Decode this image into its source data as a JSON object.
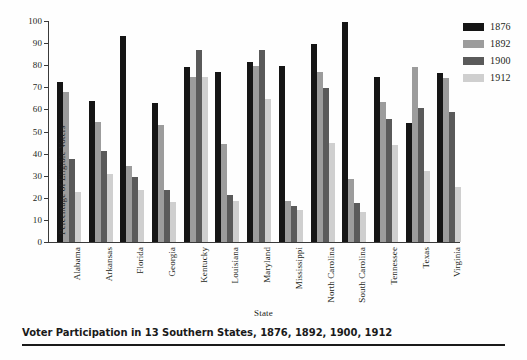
{
  "caption": {
    "text": "Voter Participation in 13 Southern States, 1876, 1892, 1900, 1912"
  },
  "legend": {
    "position": "top-right",
    "entries": [
      {
        "label": "1876",
        "color": "#151515"
      },
      {
        "label": "1892",
        "color": "#9c9c9c"
      },
      {
        "label": "1900",
        "color": "#5a5a5a"
      },
      {
        "label": "1912",
        "color": "#cfcfcf"
      }
    ]
  },
  "axes": {
    "y_title": "Percentage of Eligible Voters",
    "x_title": "State",
    "y_ticks": [
      "0",
      "10",
      "20",
      "30",
      "40",
      "50",
      "60",
      "70",
      "80",
      "90",
      "100"
    ]
  },
  "chart_data": {
    "type": "bar",
    "title": "Voter Participation in 13 Southern States, 1876, 1892, 1900, 1912",
    "xlabel": "State",
    "ylabel": "Percentage of Eligible Voters",
    "ylim": [
      0,
      100
    ],
    "ytick_values": [
      0,
      10,
      20,
      30,
      40,
      50,
      60,
      70,
      80,
      90,
      100
    ],
    "grid": false,
    "legend_position": "top-right",
    "categories": [
      "Alabama",
      "Arkansas",
      "Florida",
      "Georgia",
      "Kentucky",
      "Louisiana",
      "Maryland",
      "Mississippi",
      "North Carolina",
      "South Carolina",
      "Tennessee",
      "Texas",
      "Virginia"
    ],
    "series": [
      {
        "name": "1876",
        "color": "#151515",
        "values": [
          72.5,
          64,
          93,
          63,
          79,
          77,
          81.5,
          79.5,
          89.5,
          99.5,
          74.5,
          54,
          76.5
        ]
      },
      {
        "name": "1892",
        "color": "#9c9c9c",
        "values": [
          68,
          54.5,
          34.5,
          53,
          74.5,
          44.5,
          79.5,
          18.5,
          77,
          28.5,
          63.5,
          79,
          74
        ]
      },
      {
        "name": "1900",
        "color": "#5a5a5a",
        "values": [
          37.5,
          41,
          29.5,
          23.5,
          87,
          21.5,
          87,
          16.5,
          69.5,
          17.5,
          55.5,
          60.5,
          59
        ]
      },
      {
        "name": "1912",
        "color": "#cfcfcf",
        "values": [
          22.5,
          31,
          23.5,
          18,
          74.5,
          18.5,
          64.5,
          14.5,
          45,
          13.5,
          44,
          32,
          25
        ]
      }
    ]
  }
}
